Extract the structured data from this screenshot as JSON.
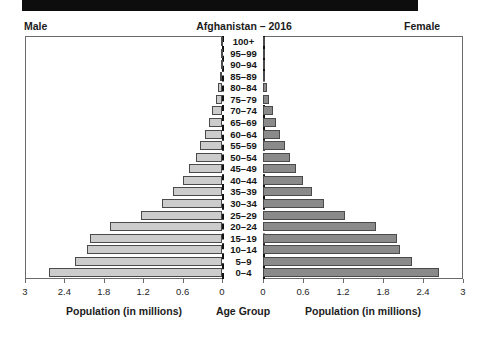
{
  "banner": {
    "color": "#0d0d0d"
  },
  "header": {
    "male_label": "Male",
    "female_label": "Female",
    "title": "Afghanistan – 2016"
  },
  "footer": {
    "left_caption": "Population (in millions)",
    "center_caption": "Age Group",
    "right_caption": "Population (in millions)"
  },
  "colors": {
    "male_bar": "#cccccc",
    "female_bar": "#8a8a8a",
    "bar_border": "#4a4a4a",
    "frame": "#6b6b6b",
    "axis": "#111111",
    "text": "#1c1c1c"
  },
  "chart_data": {
    "type": "bar",
    "title": "Afghanistan – 2016",
    "subtitle": "",
    "xlabel": "Population (in millions)",
    "ylabel": "Age Group",
    "xlim": [
      0,
      3
    ],
    "grid": false,
    "legend": "Male (left, light gray) / Female (right, dark gray)",
    "tick_values": [
      3,
      2.4,
      1.8,
      1.2,
      0.6,
      0
    ],
    "tick_labels_left": [
      "3",
      "2.4",
      "1.8",
      "1.2",
      "0.6",
      "0"
    ],
    "tick_labels_right": [
      "0",
      "0.6",
      "1.2",
      "1.8",
      "2.4",
      "3"
    ],
    "categories": [
      "100+",
      "95–99",
      "90–94",
      "85–89",
      "80–84",
      "75–79",
      "70–74",
      "65–69",
      "60–64",
      "55–59",
      "50–54",
      "45–49",
      "40–44",
      "35–39",
      "30–34",
      "25–29",
      "20–24",
      "15–19",
      "10–14",
      "5–9",
      "0–4"
    ],
    "series": [
      {
        "name": "Male",
        "side": "left",
        "color": "#cccccc",
        "values": [
          0.002,
          0.006,
          0.013,
          0.025,
          0.055,
          0.085,
          0.145,
          0.2,
          0.26,
          0.33,
          0.4,
          0.5,
          0.6,
          0.74,
          0.92,
          1.23,
          1.7,
          2.01,
          2.06,
          2.24,
          2.64
        ]
      },
      {
        "name": "Female",
        "side": "right",
        "color": "#8a8a8a",
        "values": [
          0.002,
          0.006,
          0.013,
          0.025,
          0.055,
          0.085,
          0.145,
          0.2,
          0.26,
          0.33,
          0.4,
          0.5,
          0.6,
          0.74,
          0.92,
          1.23,
          1.7,
          2.01,
          2.06,
          2.24,
          2.64
        ]
      }
    ]
  }
}
